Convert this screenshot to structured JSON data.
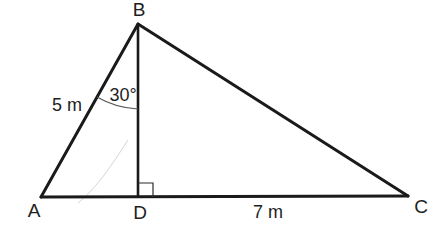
{
  "diagram": {
    "type": "geometry-triangle",
    "colors": {
      "line": "#1a1a1a",
      "text": "#1e1e1e",
      "background": "#ffffff"
    },
    "vertices": [
      {
        "id": "A",
        "label": "A",
        "x": 41,
        "y": 197
      },
      {
        "id": "B",
        "label": "B",
        "x": 138,
        "y": 24
      },
      {
        "id": "C",
        "label": "C",
        "x": 408,
        "y": 196
      },
      {
        "id": "D",
        "label": "D",
        "x": 138,
        "y": 197
      }
    ],
    "segments": [
      {
        "from": "A",
        "to": "B",
        "label": "5 m"
      },
      {
        "from": "B",
        "to": "C",
        "label": ""
      },
      {
        "from": "A",
        "to": "C",
        "label": ""
      },
      {
        "from": "B",
        "to": "D",
        "label": ""
      },
      {
        "from": "D",
        "to": "C",
        "label": "7 m"
      }
    ],
    "angles": [
      {
        "vertex": "B",
        "between": [
          "A",
          "D"
        ],
        "label": "30°"
      },
      {
        "vertex": "D",
        "between": [
          "B",
          "C"
        ],
        "label": "right-angle"
      }
    ],
    "labels": {
      "A": "A",
      "B": "B",
      "C": "C",
      "D": "D",
      "AB_length": "5 m",
      "DC_length": "7 m",
      "angle_ABD": "30°"
    }
  }
}
